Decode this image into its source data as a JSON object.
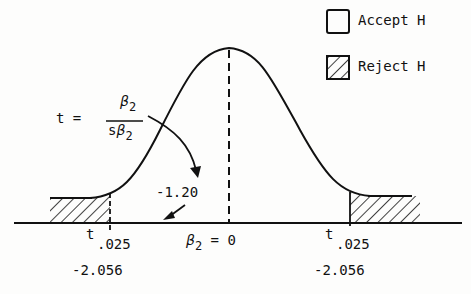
{
  "legend": {
    "accept_label": "Accept H",
    "reject_label": "Reject H"
  },
  "formula": {
    "lhs": "t =",
    "numerator": "β",
    "numerator_sub": "2",
    "denominator_prefix": "s",
    "denominator": "β",
    "denominator_sub": "2"
  },
  "annotations": {
    "observed_t": "-1.20",
    "center_symbol": "β",
    "center_sub": "2",
    "center_rest": "= 0",
    "left_crit_t": "t",
    "left_crit_sub": ".025",
    "left_crit_value": "-2.056",
    "right_crit_t": "t",
    "right_crit_sub": ".025",
    "right_crit_value": "-2.056"
  },
  "colors": {
    "ink": "#111111",
    "background": "#fdfdfc"
  }
}
